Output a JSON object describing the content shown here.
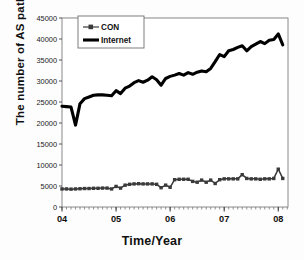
{
  "chart_data": {
    "type": "line",
    "title": "",
    "xlabel": "Time/Year",
    "ylabel": "The number of AS path",
    "xlim": [
      2004.0,
      2008.18
    ],
    "ylim": [
      0,
      45000
    ],
    "ytick_labels": [
      "0",
      "5000",
      "10000",
      "15000",
      "20000",
      "25000",
      "30000",
      "35000",
      "40000",
      "45000"
    ],
    "ytick_values": [
      0,
      5000,
      10000,
      15000,
      20000,
      25000,
      30000,
      35000,
      40000,
      45000
    ],
    "xtick_labels": [
      "04",
      "05",
      "06",
      "07",
      "08"
    ],
    "xtick_values": [
      2004,
      2005,
      2006,
      2007,
      2008
    ],
    "grid": "horizontal-faint",
    "legend_position": "top-left-inside",
    "legend": [
      "CON",
      "Internet"
    ],
    "x": [
      2004.0,
      2004.083,
      2004.167,
      2004.25,
      2004.333,
      2004.417,
      2004.5,
      2004.583,
      2004.667,
      2004.75,
      2004.833,
      2004.917,
      2005.0,
      2005.083,
      2005.167,
      2005.25,
      2005.333,
      2005.417,
      2005.5,
      2005.583,
      2005.667,
      2005.75,
      2005.833,
      2005.917,
      2006.0,
      2006.083,
      2006.167,
      2006.25,
      2006.333,
      2006.417,
      2006.5,
      2006.583,
      2006.667,
      2006.75,
      2006.833,
      2006.917,
      2007.0,
      2007.083,
      2007.167,
      2007.25,
      2007.333,
      2007.417,
      2007.5,
      2007.583,
      2007.667,
      2007.75,
      2007.833,
      2007.917,
      2008.0,
      2008.083
    ],
    "series": [
      {
        "name": "Internet",
        "style": "thick-black-line",
        "color": "#000000",
        "values": [
          24000,
          23900,
          23800,
          19500,
          24600,
          25800,
          26200,
          26600,
          26700,
          26700,
          26600,
          26500,
          27700,
          27000,
          28300,
          28800,
          29600,
          30100,
          29700,
          30200,
          31000,
          30300,
          29000,
          30600,
          31100,
          31400,
          31800,
          31400,
          32000,
          31600,
          32100,
          32400,
          32200,
          33000,
          34600,
          36300,
          35800,
          37200,
          37500,
          38000,
          38400,
          37200,
          38200,
          38800,
          39400,
          38900,
          39700,
          39900,
          41200,
          38600
        ]
      },
      {
        "name": "CON",
        "style": "thin-line-with-square-markers",
        "color": "#3a3a3a",
        "values": [
          4300,
          4300,
          4250,
          4300,
          4350,
          4400,
          4400,
          4450,
          4450,
          4500,
          4500,
          4300,
          4900,
          4500,
          5200,
          5400,
          5500,
          5550,
          5500,
          5500,
          5500,
          5400,
          4600,
          5200,
          4700,
          6500,
          6600,
          6600,
          6600,
          6100,
          5900,
          6400,
          5900,
          6400,
          5600,
          6500,
          6700,
          6700,
          6700,
          6700,
          7700,
          6800,
          6700,
          6700,
          6600,
          6700,
          6700,
          6800,
          9000,
          6800
        ]
      }
    ]
  }
}
